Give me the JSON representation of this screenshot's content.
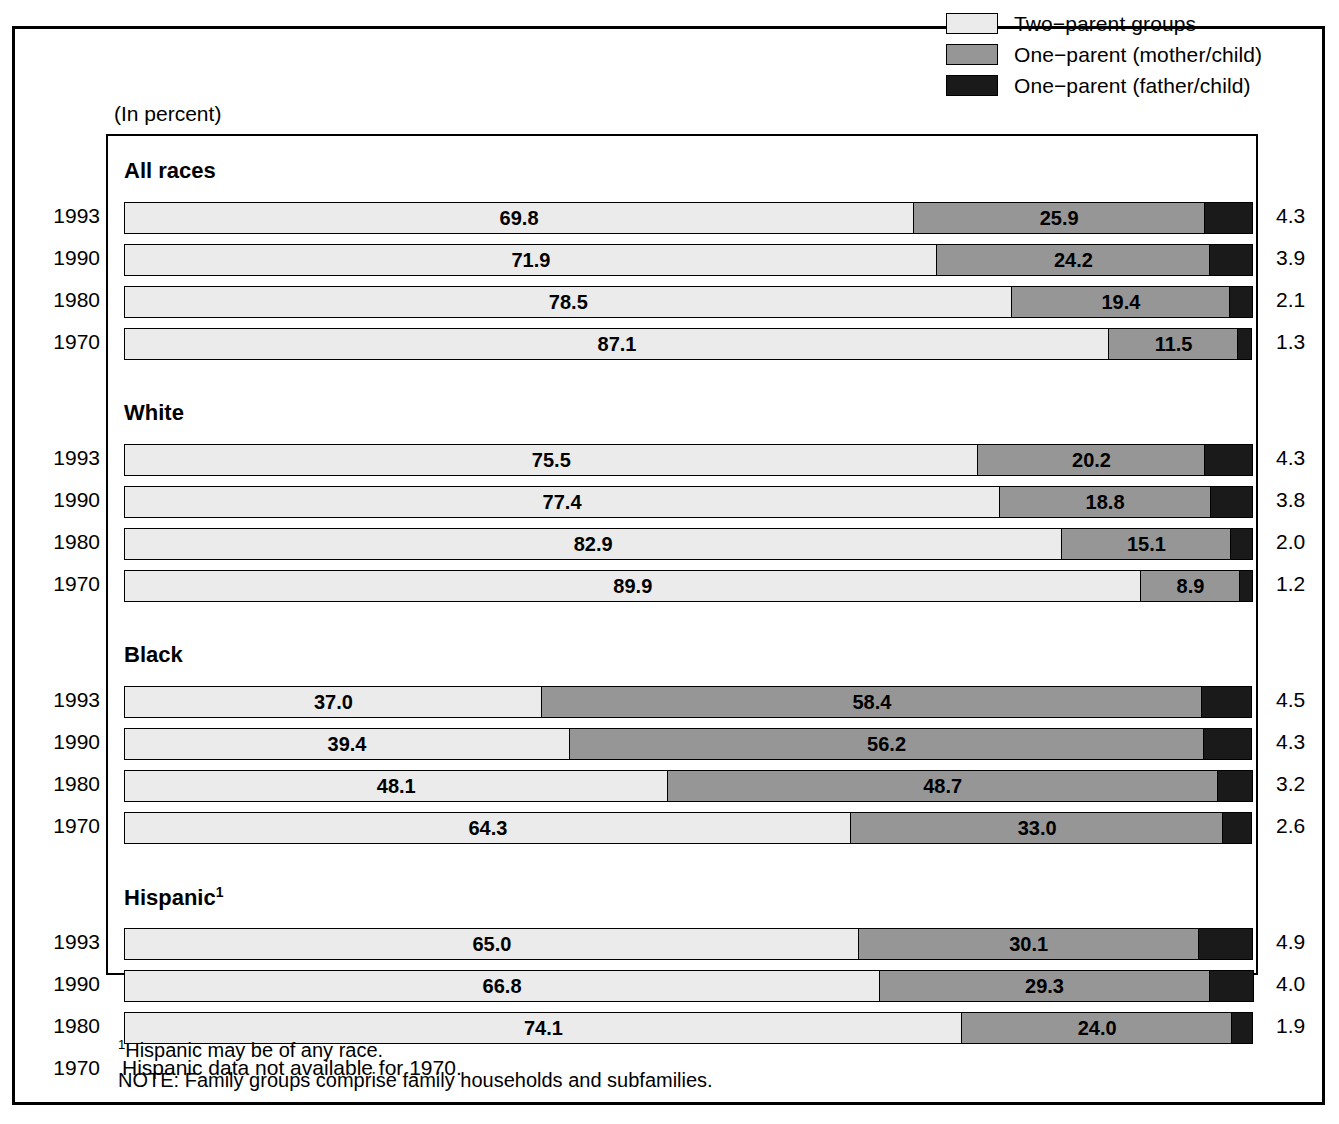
{
  "units_label": "(In percent)",
  "legend": {
    "items": [
      {
        "key": "two",
        "label": "Two−parent groups",
        "color": "#ebebeb"
      },
      {
        "key": "mother",
        "label": "One−parent (mother/child)",
        "color": "#969696"
      },
      {
        "key": "father",
        "label": "One−parent (father/child)",
        "color": "#1a1a1a"
      }
    ]
  },
  "footnotes": {
    "line1_marker": "1",
    "line1": "Hispanic may be of any race.",
    "line2": "NOTE:  Family groups comprise family households and subfamilies."
  },
  "na_note": "Hispanic data not available for 1970.",
  "groups": [
    {
      "title": "All races",
      "superscript": "",
      "rows": [
        {
          "year": "1993",
          "two": "69.8",
          "mother": "25.9",
          "father": "4.3"
        },
        {
          "year": "1990",
          "two": "71.9",
          "mother": "24.2",
          "father": "3.9"
        },
        {
          "year": "1980",
          "two": "78.5",
          "mother": "19.4",
          "father": "2.1"
        },
        {
          "year": "1970",
          "two": "87.1",
          "mother": "11.5",
          "father": "1.3"
        }
      ]
    },
    {
      "title": "White",
      "superscript": "",
      "rows": [
        {
          "year": "1993",
          "two": "75.5",
          "mother": "20.2",
          "father": "4.3"
        },
        {
          "year": "1990",
          "two": "77.4",
          "mother": "18.8",
          "father": "3.8"
        },
        {
          "year": "1980",
          "two": "82.9",
          "mother": "15.1",
          "father": "2.0"
        },
        {
          "year": "1970",
          "two": "89.9",
          "mother": "8.9",
          "father": "1.2"
        }
      ]
    },
    {
      "title": "Black",
      "superscript": "",
      "rows": [
        {
          "year": "1993",
          "two": "37.0",
          "mother": "58.4",
          "father": "4.5"
        },
        {
          "year": "1990",
          "two": "39.4",
          "mother": "56.2",
          "father": "4.3"
        },
        {
          "year": "1980",
          "two": "48.1",
          "mother": "48.7",
          "father": "3.2"
        },
        {
          "year": "1970",
          "two": "64.3",
          "mother": "33.0",
          "father": "2.6"
        }
      ]
    },
    {
      "title": "Hispanic",
      "superscript": "1",
      "rows": [
        {
          "year": "1993",
          "two": "65.0",
          "mother": "30.1",
          "father": "4.9"
        },
        {
          "year": "1990",
          "two": "66.8",
          "mother": "29.3",
          "father": "4.0"
        },
        {
          "year": "1980",
          "two": "74.1",
          "mother": "24.0",
          "father": "1.9"
        },
        {
          "year": "1970",
          "two": null,
          "mother": null,
          "father": null
        }
      ]
    }
  ],
  "chart_data": {
    "type": "bar",
    "subtitle": "(In percent)",
    "orientation": "horizontal",
    "stacked": true,
    "xlabel": "percent",
    "ylabel": "",
    "xlim": [
      0,
      100
    ],
    "grid": false,
    "legend_position": "top-right",
    "series": [
      {
        "name": "Two−parent groups",
        "color": "#ebebeb"
      },
      {
        "name": "One−parent (mother/child)",
        "color": "#969696"
      },
      {
        "name": "One−parent (father/child)",
        "color": "#1a1a1a"
      }
    ],
    "panels": [
      {
        "category": "All races",
        "categories": [
          "1993",
          "1990",
          "1980",
          "1970"
        ],
        "values": {
          "Two−parent groups": [
            69.8,
            71.9,
            78.5,
            87.1
          ],
          "One−parent (mother/child)": [
            25.9,
            24.2,
            19.4,
            11.5
          ],
          "One−parent (father/child)": [
            4.3,
            3.9,
            2.1,
            1.3
          ]
        }
      },
      {
        "category": "White",
        "categories": [
          "1993",
          "1990",
          "1980",
          "1970"
        ],
        "values": {
          "Two−parent groups": [
            75.5,
            77.4,
            82.9,
            89.9
          ],
          "One−parent (mother/child)": [
            20.2,
            18.8,
            15.1,
            8.9
          ],
          "One−parent (father/child)": [
            4.3,
            3.8,
            2.0,
            1.2
          ]
        }
      },
      {
        "category": "Black",
        "categories": [
          "1993",
          "1990",
          "1980",
          "1970"
        ],
        "values": {
          "Two−parent groups": [
            37.0,
            39.4,
            48.1,
            64.3
          ],
          "One−parent (mother/child)": [
            58.4,
            56.2,
            48.7,
            33.0
          ],
          "One−parent (father/child)": [
            4.5,
            4.3,
            3.2,
            2.6
          ]
        }
      },
      {
        "category": "Hispanic",
        "categories": [
          "1993",
          "1990",
          "1980",
          "1970"
        ],
        "values": {
          "Two−parent groups": [
            65.0,
            66.8,
            74.1,
            null
          ],
          "One−parent (mother/child)": [
            30.1,
            29.3,
            24.0,
            null
          ],
          "One−parent (father/child)": [
            4.9,
            4.0,
            1.9,
            null
          ]
        },
        "note": "Hispanic data not available for 1970."
      }
    ],
    "annotations": [
      "1Hispanic may be of any race.",
      "NOTE:  Family groups comprise family households and subfamilies."
    ]
  }
}
